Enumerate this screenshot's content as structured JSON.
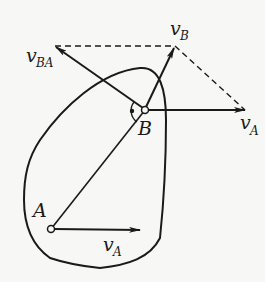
{
  "diagram": {
    "type": "rigid-body velocity composition",
    "points": [
      {
        "id": "A",
        "label": "A"
      },
      {
        "id": "B",
        "label": "B"
      }
    ],
    "vectors": [
      {
        "id": "vA_at_A",
        "base": "v",
        "sub": "A",
        "from": "A",
        "direction": "horizontal right"
      },
      {
        "id": "vA_at_B",
        "base": "v",
        "sub": "A",
        "from": "B",
        "direction": "horizontal right"
      },
      {
        "id": "vBA",
        "base": "v",
        "sub": "BA",
        "from": "B",
        "direction": "up-left, perpendicular to AB"
      },
      {
        "id": "vB",
        "base": "v",
        "sub": "B",
        "from": "B",
        "direction": "up-right (resultant)"
      }
    ],
    "annotations": [
      "right-angle mark at B between AB and vBA",
      "dashed parallelogram lines"
    ],
    "colors": {
      "ink": "#1a1a1a",
      "background": "#f7f7f5"
    }
  }
}
